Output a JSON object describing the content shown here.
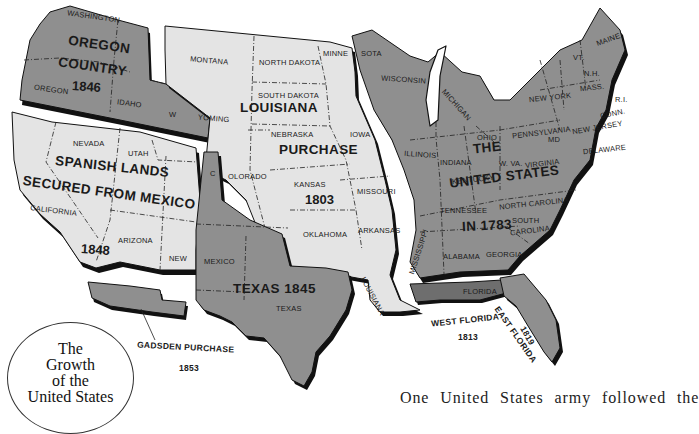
{
  "title": {
    "line1": "The",
    "line2": "Growth",
    "line3": "of the",
    "line4": "United States"
  },
  "colors": {
    "acquired_dark": "#8f8f8f",
    "acquired_light": "#e4e4e4",
    "outline": "#111111",
    "background": "#ffffff"
  },
  "regions": {
    "oregon": {
      "name_line1": "OREGON",
      "name_line2": "COUNTRY",
      "year": "1846"
    },
    "louisiana": {
      "name_line1": "LOUISIANA",
      "name_line2": "PURCHASE",
      "year": "1803"
    },
    "spanish": {
      "name_line1": "SPANISH LANDS",
      "name_line2": "SECURED FROM MEXICO",
      "year": "1848"
    },
    "texas": {
      "name": "TEXAS 1845"
    },
    "us1783": {
      "name_line1": "THE",
      "name_line2": "UNITED STATES",
      "name_line3": "IN 1783"
    },
    "gadsden": {
      "name": "GADSDEN PURCHASE",
      "year": "1853"
    },
    "west_florida": {
      "name": "WEST FLORIDA",
      "year": "1813"
    },
    "east_florida": {
      "name": "EAST FLORIDA",
      "year": "1819"
    }
  },
  "states": {
    "washington": "WASHINGTON",
    "oregon": "OREGON",
    "idaho": "IDAHO",
    "wyoming_w": "W",
    "montana": "MONTANA",
    "wyoming": "YOMING",
    "north_dakota": "NORTH DAKOTA",
    "south_dakota": "SOUTH DAKOTA",
    "minnesota_a": "MINNE",
    "minnesota_b": "SOTA",
    "nebraska": "NEBRASKA",
    "iowa": "IOWA",
    "colorado": "OLORADO",
    "colorado_c": "C",
    "kansas": "KANSAS",
    "missouri": "MISSOURI",
    "oklahoma": "OKLAHOMA",
    "arkansas": "ARKANSAS",
    "louisiana": "LOUISIANA",
    "nevada": "NEVADA",
    "utah": "UTAH",
    "california": "CALIFORNIA",
    "arizona": "ARIZONA",
    "new_mexico_a": "NEW",
    "new_mexico_b": "MEXICO",
    "texas": "TEXAS",
    "wisconsin": "WISCONSIN",
    "michigan": "MICHIGAN",
    "illinois": "ILLINOIS",
    "indiana": "INDIANA",
    "ohio": "OHIO",
    "kentucky": "KENTUCKY",
    "tennessee": "TENNESSEE",
    "mississippi": "MISSISSIPPI",
    "alabama": "ALABAMA",
    "georgia": "GEORGIA",
    "florida": "FLORIDA",
    "south_carolina_a": "SOUTH",
    "south_carolina_b": "CAROLINA",
    "north_carolina": "NORTH CAROLINA",
    "virginia": "VIRGINIA",
    "west_virginia": "W. VA.",
    "pennsylvania": "PENNSYLVANIA",
    "new_york": "NEW YORK",
    "maryland": "MD",
    "delaware": "DELAWARE",
    "new_jersey": "NEW JERSEY",
    "connecticut": "CONN.",
    "rhode_island": "R.I.",
    "massachusetts": "MASS.",
    "new_hampshire": "N.H.",
    "vermont": "VT.",
    "maine": "MAINE"
  },
  "body_text": "One United States army followed the"
}
